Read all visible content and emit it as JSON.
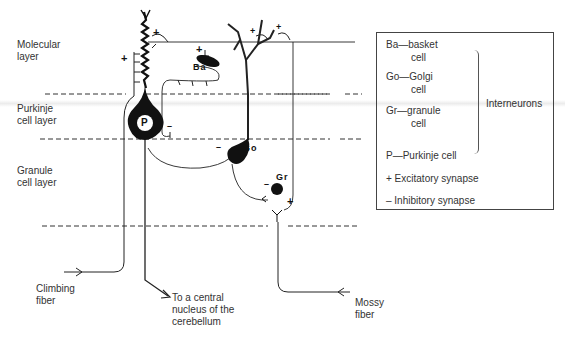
{
  "figure": {
    "layers": [
      {
        "id": "molecular",
        "label": "Molecular\nlayer"
      },
      {
        "id": "purkinje",
        "label": "Purkinje\ncell layer"
      },
      {
        "id": "granule",
        "label": "Granule\ncell layer"
      }
    ],
    "cells": {
      "purkinje": "P",
      "basket": "Ba",
      "golgi": "Go",
      "granule": "Gr"
    },
    "fibers": {
      "climbing": "Climbing\nfiber",
      "mossy": "Mossy\nfiber",
      "output": "To a central\nnucleus of the\ncerebellum"
    },
    "synapse_signs": {
      "excitatory": "+",
      "inhibitory": "–"
    }
  },
  "legend": {
    "interneurons": [
      {
        "abbr": "Ba",
        "name": "basket",
        "suffix": "cell"
      },
      {
        "abbr": "Go",
        "name": "Golgi",
        "suffix": "cell"
      },
      {
        "abbr": "Gr",
        "name": "granule",
        "suffix": "cell"
      }
    ],
    "group_label": "Interneurons",
    "purkinje": "P—Purkinje  cell",
    "excitatory": "+  Excitatory synapse",
    "inhibitory": "–  Inhibitory synapse"
  },
  "colors": {
    "ink": "#111111",
    "text": "#333333",
    "background": "#ffffff"
  }
}
